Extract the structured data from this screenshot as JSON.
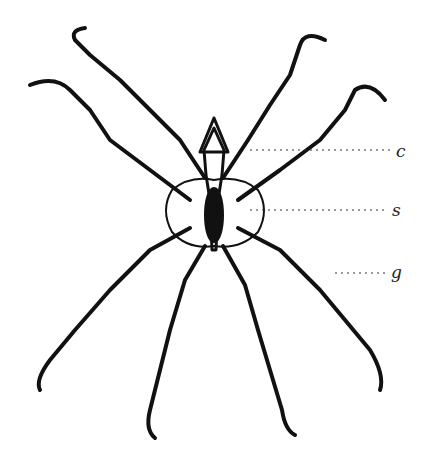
{
  "figure": {
    "stroke_color": "#111111",
    "background": "#ffffff",
    "labels": [
      {
        "text": "c",
        "x": 398,
        "y": 152
      },
      {
        "text": "s",
        "x": 393,
        "y": 212
      },
      {
        "text": "g",
        "x": 392,
        "y": 276
      }
    ]
  }
}
